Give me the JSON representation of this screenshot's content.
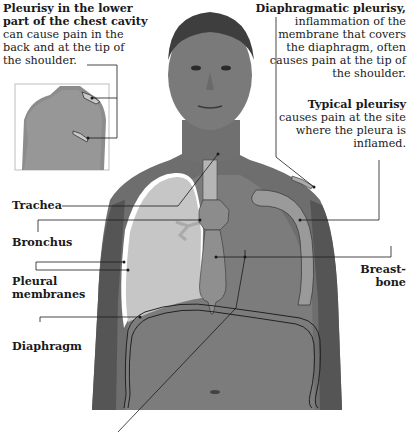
{
  "diagram": {
    "colors": {
      "background": "#ffffff",
      "skin_dark": "#5a5a5a",
      "skin_mid": "#777777",
      "organ_fill": "#b8b8b8",
      "organ_dark": "#8a8a8a",
      "leader_line": "#1a1a1a"
    }
  },
  "callouts": {
    "lower_chest": {
      "title": "Pleurisy in the lower part of the chest cavity",
      "title_line1": "Pleurisy in the lower",
      "title_line2": "part of the chest cavity",
      "body_line1": "can cause pain in the",
      "body_line2": "back and at the tip of",
      "body_line3": "the shoulder."
    },
    "diaphragmatic": {
      "title": "Diaphragmatic pleurisy,",
      "body_line1": "inflammation of the",
      "body_line2": "membrane that covers",
      "body_line3": "the diaphragm, often",
      "body_line4": "causes pain at the tip of",
      "body_line5": "the shoulder."
    },
    "typical": {
      "title": "Typical pleurisy",
      "body_line1": "causes pain at the site",
      "body_line2": "where the pleura is",
      "body_line3": "inflamed."
    }
  },
  "labels": {
    "trachea": "Trachea",
    "bronchus": "Bronchus",
    "pleural_1": "Pleural",
    "pleural_2": "membranes",
    "diaphragm": "Diaphragm",
    "breastbone_1": "Breast-",
    "breastbone_2": "bone"
  },
  "inset": {
    "description": "back view of torso with highlighted shoulder and lower-back pain areas"
  }
}
